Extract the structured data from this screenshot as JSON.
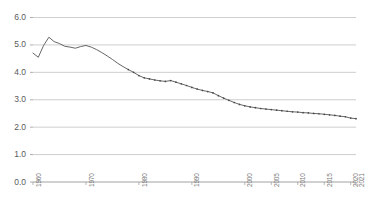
{
  "chart_data": {
    "type": "line",
    "title": "",
    "subtitle": "",
    "xlabel": "",
    "ylabel": "",
    "xlim": [
      1960,
      2021
    ],
    "ylim": [
      0.0,
      6.0
    ],
    "grid": true,
    "legend": false,
    "legend_position": "none",
    "line_color": "#555555",
    "marker": "dot",
    "y_ticks": [
      "0.0",
      "1.0",
      "2.0",
      "3.0",
      "4.0",
      "5.0",
      "6.0"
    ],
    "y_tick_values": [
      0.0,
      1.0,
      2.0,
      3.0,
      4.0,
      5.0,
      6.0
    ],
    "x_ticks": [
      "1960",
      "1970",
      "1980",
      "1990",
      "2000",
      "2005",
      "2010",
      "2015",
      "2020",
      "2021"
    ],
    "x_tick_values": [
      1960,
      1970,
      1980,
      1990,
      2000,
      2005,
      2010,
      2015,
      2020,
      2021
    ],
    "x": [
      1960,
      1961,
      1962,
      1963,
      1964,
      1965,
      1966,
      1967,
      1968,
      1969,
      1970,
      1971,
      1972,
      1973,
      1974,
      1975,
      1976,
      1977,
      1978,
      1979,
      1980,
      1981,
      1982,
      1983,
      1984,
      1985,
      1986,
      1987,
      1988,
      1989,
      1990,
      1991,
      1992,
      1993,
      1994,
      1995,
      1996,
      1997,
      1998,
      1999,
      2000,
      2001,
      2002,
      2003,
      2004,
      2005,
      2006,
      2007,
      2008,
      2009,
      2010,
      2011,
      2012,
      2013,
      2014,
      2015,
      2016,
      2017,
      2018,
      2019,
      2020,
      2021
    ],
    "values": [
      4.7,
      4.55,
      4.98,
      5.28,
      5.12,
      5.05,
      4.95,
      4.92,
      4.88,
      4.94,
      4.98,
      4.92,
      4.83,
      4.72,
      4.6,
      4.47,
      4.33,
      4.21,
      4.1,
      4.0,
      3.88,
      3.8,
      3.76,
      3.72,
      3.69,
      3.67,
      3.7,
      3.64,
      3.58,
      3.52,
      3.45,
      3.39,
      3.34,
      3.3,
      3.25,
      3.15,
      3.06,
      2.98,
      2.9,
      2.83,
      2.78,
      2.74,
      2.71,
      2.68,
      2.66,
      2.64,
      2.62,
      2.6,
      2.58,
      2.56,
      2.55,
      2.53,
      2.52,
      2.5,
      2.49,
      2.47,
      2.45,
      2.43,
      2.4,
      2.38,
      2.33,
      2.31
    ]
  }
}
